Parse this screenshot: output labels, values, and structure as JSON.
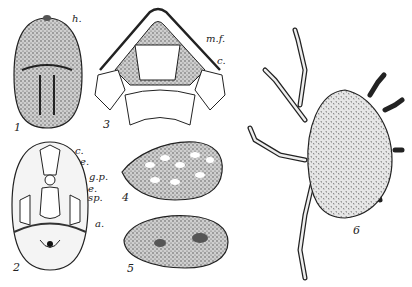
{
  "figures": [
    {
      "number": "1",
      "labels": [
        "h."
      ]
    },
    {
      "number": "2",
      "labels": [
        "c.",
        "e.",
        "g.p.",
        "e.",
        "sp.",
        "a."
      ]
    },
    {
      "number": "3",
      "labels": [
        "m.f.",
        "c."
      ]
    },
    {
      "number": "4",
      "labels": []
    },
    {
      "number": "5",
      "labels": []
    },
    {
      "number": "6",
      "labels": []
    }
  ],
  "colors": {
    "ink": "#222222",
    "background": "#ffffff",
    "stipple": "#777777"
  }
}
